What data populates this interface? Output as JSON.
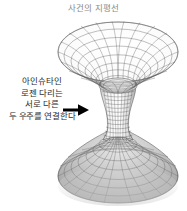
{
  "figure": {
    "title": "사건의 지평선",
    "title_color": "#8a8a8a",
    "background_color": "#ffffff",
    "width": 187,
    "height": 211
  },
  "annotation": {
    "lines": [
      "아인슈타인",
      "로젠 다리는",
      "서로 다른",
      "두 우주를 연결한다"
    ],
    "text_color": "#2b2b2b",
    "arrow": {
      "icon": "arrow-right-icon",
      "color": "#000000",
      "direction": "right"
    }
  },
  "diagram": {
    "name": "einstein-rosen-bridge-wormhole",
    "parts": [
      {
        "name": "upper-funnel",
        "label": "upper universe sheet",
        "shading": "light",
        "line_color": "#4a4a4a",
        "fill_color": "#ffffff"
      },
      {
        "name": "throat",
        "label": "wormhole throat",
        "shading": "medium",
        "line_color": "#3a3a3a",
        "fill_color": "#f2f2f2"
      },
      {
        "name": "lower-funnel",
        "label": "lower universe sheet",
        "shading": "dark",
        "line_color": "#4a4a4a",
        "fill_color": "#b8b8b8"
      }
    ],
    "grid": {
      "meridians": 24,
      "parallels_upper": 9,
      "parallels_throat": 12,
      "parallels_lower": 9
    }
  }
}
